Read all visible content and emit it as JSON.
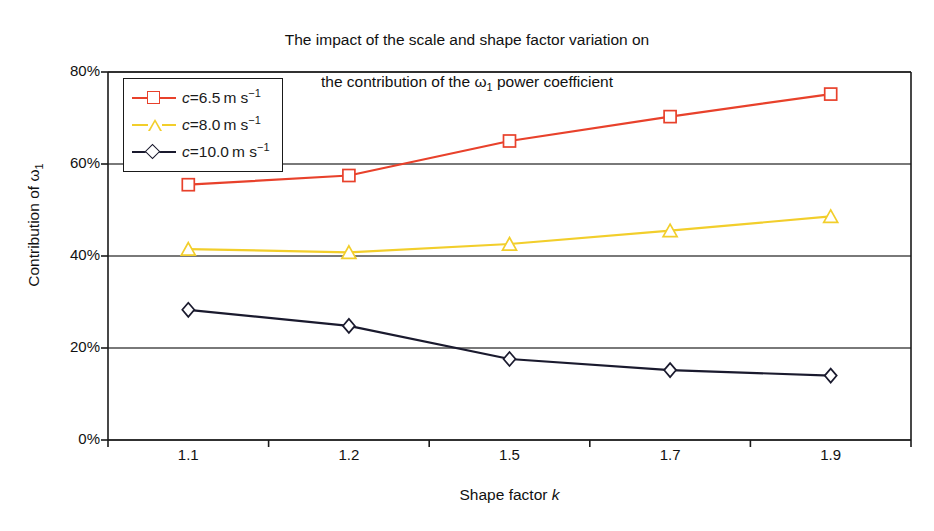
{
  "chart_data": {
    "type": "line",
    "title_line1": "The impact of the scale and shape factor variation on",
    "title_line2_pre": "the contribution of the ",
    "title_line2_omega": "ω",
    "title_line2_sub": "1",
    "title_line2_post": " power coefficient",
    "xlabel": "Shape factor k",
    "xlabel_text": "Shape factor ",
    "xlabel_var": "k",
    "ylabel": "Contribution of ω₁",
    "ylabel_text": "Contribution of ",
    "ylabel_omega": "ω",
    "ylabel_sub": "1",
    "categories": [
      "1.1",
      "1.2",
      "1.5",
      "1.7",
      "1.9"
    ],
    "x": [
      1.1,
      1.2,
      1.5,
      1.7,
      1.9
    ],
    "ylim": [
      0,
      80
    ],
    "yticks": [
      "0%",
      "20%",
      "40%",
      "60%",
      "80%"
    ],
    "ytick_values": [
      0,
      20,
      40,
      60,
      80
    ],
    "grid": "horizontal",
    "legend_position": "top-left inside plot",
    "series": [
      {
        "name": "c = 6.5 m s⁻¹",
        "label_var": "c",
        "label_eq": "=",
        "label_value": "6.5",
        "label_unit": "m s",
        "label_exp": "−1",
        "color": "#E8412B",
        "marker": "square",
        "values": [
          55.5,
          57.5,
          65.0,
          70.3,
          75.2
        ]
      },
      {
        "name": "c = 8.0 m s⁻¹",
        "label_var": "c",
        "label_eq": "=",
        "label_value": "8.0",
        "label_unit": "m s",
        "label_exp": "−1",
        "color": "#F2CE2B",
        "marker": "triangle",
        "values": [
          41.5,
          40.8,
          42.6,
          45.5,
          48.6
        ]
      },
      {
        "name": "c = 10.0 m s⁻¹",
        "label_var": "c",
        "label_eq": "=",
        "label_value": "10.0",
        "label_unit": "m s",
        "label_exp": "−1",
        "color": "#1A1A2E",
        "marker": "diamond",
        "values": [
          28.3,
          24.8,
          17.6,
          15.2,
          14.0
        ]
      }
    ],
    "axis_color": "#1a1a1a",
    "gridline_color": "#4d4d4d",
    "background": "#ffffff"
  }
}
